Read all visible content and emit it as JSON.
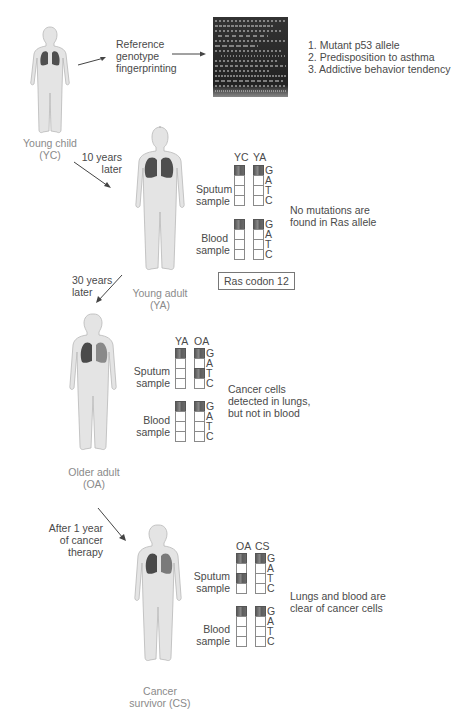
{
  "stages": {
    "yc": {
      "label_line1": "Young child",
      "label_line2": "(YC)"
    },
    "ya": {
      "label_line1": "Young adult",
      "label_line2": "(YA)"
    },
    "oa": {
      "label_line1": "Older adult",
      "label_line2": "(OA)"
    },
    "cs": {
      "label_line1": "Cancer",
      "label_line2": "survivor (CS)"
    }
  },
  "fingerprinting": {
    "label_line1": "Reference",
    "label_line2": "genotype",
    "label_line3": "fingerprinting",
    "findings": [
      "1. Mutant p53 allele",
      "2. Predisposition to asthma",
      "3. Addictive behavior tendency"
    ]
  },
  "transitions": {
    "t1": {
      "line1": "10 years",
      "line2": "later"
    },
    "t2": {
      "line1": "30 years",
      "line2": "later"
    },
    "t3": {
      "line1": "After 1 year",
      "line2": "of cancer",
      "line3": "therapy"
    }
  },
  "sample_labels": {
    "sputum_line1": "Sputum",
    "sputum_line2": "sample",
    "blood_line1": "Blood",
    "blood_line2": "sample"
  },
  "bases": [
    "G",
    "A",
    "T",
    "C"
  ],
  "panels": [
    {
      "columns": [
        "YC",
        "YA"
      ],
      "sputum": [
        [
          "G"
        ],
        [
          "G"
        ]
      ],
      "blood": [
        [
          "G"
        ],
        [
          "G"
        ]
      ],
      "note_line1": "No mutations are",
      "note_line2": "found in Ras allele",
      "footer": "Ras codon 12"
    },
    {
      "columns": [
        "YA",
        "OA"
      ],
      "sputum": [
        [
          "G"
        ],
        [
          "G",
          "T"
        ]
      ],
      "blood": [
        [
          "G"
        ],
        [
          "G"
        ]
      ],
      "note_line1": "Cancer cells",
      "note_line2": "detected in lungs,",
      "note_line3": "but not in blood"
    },
    {
      "columns": [
        "OA",
        "CS"
      ],
      "sputum": [
        [
          "G",
          "T"
        ],
        [
          "G"
        ]
      ],
      "blood": [
        [
          "G"
        ],
        [
          "G"
        ]
      ],
      "note_line1": "Lungs and blood are",
      "note_line2": "clear of cancer cells"
    }
  ],
  "colors": {
    "body": "#e2e2e2",
    "body_outline": "#b5b5b5",
    "lung": "#4e4e4e",
    "band": "#6a6a6a",
    "text": "#4a4a4a"
  }
}
